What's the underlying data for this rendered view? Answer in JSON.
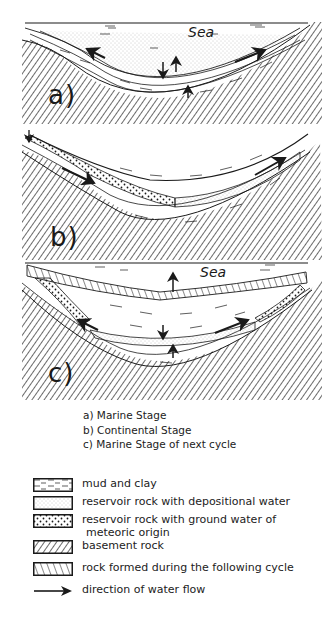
{
  "figure": {
    "panels": [
      {
        "id": "a",
        "label": "a)",
        "sea_label": "Sea",
        "stage": "Marine Stage"
      },
      {
        "id": "b",
        "label": "b)",
        "sea_label": "",
        "stage": "Continental Stage"
      },
      {
        "id": "c",
        "label": "c)",
        "sea_label": "Sea",
        "stage": "Marine Stage of next cycle"
      }
    ],
    "stage_captions": [
      "a) Marine Stage",
      "b) Continental Stage",
      "c) Marine Stage of next cycle"
    ],
    "legend": [
      {
        "pattern": "dashes",
        "label": "mud  and clay",
        "label2": ""
      },
      {
        "pattern": "fine-stipple",
        "label": "reservoir rock  with depositional water",
        "label2": ""
      },
      {
        "pattern": "coarse-dots",
        "label": "reservoir rock with ground water of",
        "label2": "meteoric origin"
      },
      {
        "pattern": "dense-hatch",
        "label": "basement rock",
        "label2": ""
      },
      {
        "pattern": "sparse-hatch",
        "label": "rock formed during the following cycle",
        "label2": ""
      },
      {
        "pattern": "arrow",
        "label": "direction of water flow",
        "label2": ""
      }
    ],
    "colors": {
      "ink": "#1a1a1a",
      "paper": "#ffffff",
      "stipple": "#9a9a9a"
    }
  }
}
